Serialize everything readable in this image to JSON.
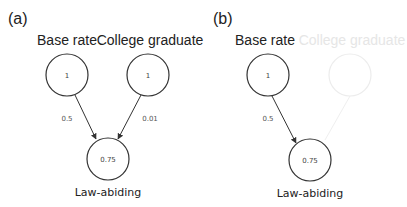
{
  "panels": [
    {
      "label": "(a)",
      "nodes": {
        "base": {
          "title": "Base rate",
          "value": "1"
        },
        "college": {
          "title": "College graduate",
          "value": "1"
        },
        "law": {
          "title": "Law-abiding",
          "value": "0.75"
        }
      },
      "edges": {
        "base_to_law": "0.5",
        "college_to_law": "0.01"
      }
    },
    {
      "label": "(b)",
      "nodes": {
        "base": {
          "title": "Base rate",
          "value": "1"
        },
        "college": {
          "title": "College graduate",
          "value": ""
        },
        "law": {
          "title": "Law-abiding",
          "value": "0.75"
        }
      },
      "edges": {
        "base_to_law": "0.5"
      }
    }
  ],
  "colors": {
    "stroke": "#333333",
    "faded": "#e6e6e6",
    "background": "#ffffff"
  }
}
